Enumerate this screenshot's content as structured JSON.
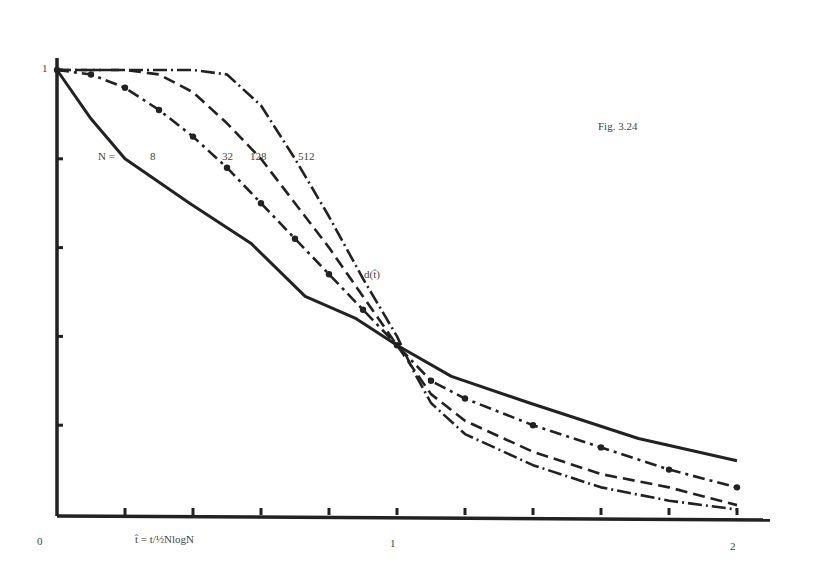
{
  "chart_data": {
    "type": "line",
    "title": "Fig. 3.24",
    "xlabel": "t̂ = t/½NlogN",
    "ylabel": "",
    "curve_label": "d(t̂)",
    "legend_prefix": "N =",
    "xlim": [
      0,
      2
    ],
    "ylim": [
      0,
      1
    ],
    "x_tick_labels": [
      "0",
      "1",
      "2"
    ],
    "y_tick_labels": [
      "1"
    ],
    "x_ticks": [
      0,
      0.2,
      0.4,
      0.6,
      0.8,
      1.0,
      1.2,
      1.4,
      1.6,
      1.8,
      2.0
    ],
    "y_ticks": [
      0,
      0.2,
      0.4,
      0.6,
      0.8,
      1.0
    ],
    "grid": false,
    "series": [
      {
        "name": "8",
        "style": "solid",
        "x": [
          0,
          0.1,
          0.2,
          0.39,
          0.57,
          0.73,
          0.88,
          1.0,
          1.16,
          1.39,
          1.71,
          2.0
        ],
        "y": [
          1.0,
          0.89,
          0.8,
          0.7,
          0.61,
          0.49,
          0.44,
          0.38,
          0.31,
          0.25,
          0.17,
          0.12
        ]
      },
      {
        "name": "32",
        "style": "dash-dot",
        "x": [
          0,
          0.1,
          0.2,
          0.3,
          0.4,
          0.5,
          0.6,
          0.7,
          0.8,
          0.9,
          1.0,
          1.1,
          1.2,
          1.4,
          1.6,
          1.8,
          2.0
        ],
        "y": [
          1.0,
          0.99,
          0.96,
          0.91,
          0.85,
          0.78,
          0.7,
          0.62,
          0.54,
          0.46,
          0.38,
          0.3,
          0.26,
          0.2,
          0.15,
          0.1,
          0.06
        ]
      },
      {
        "name": "128",
        "style": "dashed",
        "x": [
          0,
          0.2,
          0.3,
          0.4,
          0.5,
          0.6,
          0.7,
          0.8,
          0.9,
          1.0,
          1.1,
          1.2,
          1.4,
          1.6,
          1.8,
          2.0
        ],
        "y": [
          1.0,
          1.0,
          0.99,
          0.95,
          0.88,
          0.8,
          0.7,
          0.6,
          0.49,
          0.38,
          0.27,
          0.21,
          0.14,
          0.09,
          0.06,
          0.02
        ]
      },
      {
        "name": "512",
        "style": "dash-cross",
        "x": [
          0,
          0.2,
          0.4,
          0.5,
          0.6,
          0.7,
          0.8,
          0.9,
          1.0,
          1.05,
          1.1,
          1.2,
          1.4,
          1.6,
          1.8,
          2.0
        ],
        "y": [
          1.0,
          1.0,
          1.0,
          0.99,
          0.92,
          0.8,
          0.67,
          0.53,
          0.4,
          0.32,
          0.25,
          0.18,
          0.11,
          0.06,
          0.03,
          0.01
        ]
      }
    ]
  }
}
